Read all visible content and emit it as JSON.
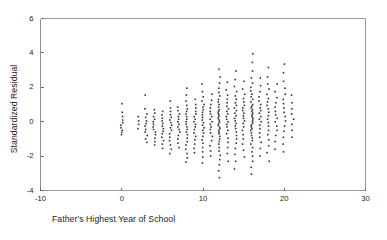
{
  "chart_data": {
    "type": "scatter",
    "title": "",
    "xlabel": "Father's Highest Year of School",
    "ylabel": "Standardized Residual",
    "xlim": [
      -10,
      30
    ],
    "ylim": [
      -4,
      6
    ],
    "xticks": [
      -10,
      0,
      10,
      20,
      30
    ],
    "yticks": [
      -4,
      -2,
      0,
      2,
      4,
      6
    ],
    "xtick_labels": [
      "-10",
      "0",
      "10",
      "20",
      "30"
    ],
    "ytick_labels": [
      "-4",
      "-2",
      "0",
      "2",
      "4",
      "6"
    ],
    "grid": false,
    "legend": false,
    "marker": "small-square",
    "marker_color": "#333333",
    "frame_color": "#9a9a9a",
    "background": "#ffffff",
    "note": "Discrete integer x values (years of school) produce vertical stripes of residuals.",
    "columns": [
      {
        "x": 0,
        "values": [
          0.55,
          0.3,
          0.1,
          -0.05,
          -0.2,
          -0.35,
          -0.5,
          -0.62,
          -0.75,
          1.05
        ]
      },
      {
        "x": 2,
        "values": [
          0.3,
          0.05,
          -0.15,
          -0.4
        ]
      },
      {
        "x": 3,
        "values": [
          1.55,
          0.75,
          0.45,
          0.25,
          0.05,
          -0.1,
          -0.25,
          -0.45,
          -0.6,
          -0.8,
          -1.0,
          -1.2
        ]
      },
      {
        "x": 4,
        "values": [
          0.7,
          0.5,
          0.3,
          0.15,
          0.0,
          -0.15,
          -0.3,
          -0.45,
          -0.6,
          -0.75,
          -0.95,
          -1.15,
          -1.35
        ]
      },
      {
        "x": 5,
        "values": [
          0.6,
          0.4,
          0.2,
          0.05,
          -0.1,
          -0.25,
          -0.4,
          -0.55,
          -0.7,
          -0.9,
          -1.1,
          -1.3,
          -1.55
        ]
      },
      {
        "x": 6,
        "values": [
          1.2,
          0.8,
          0.6,
          0.4,
          0.25,
          0.1,
          -0.05,
          -0.2,
          -0.35,
          -0.5,
          -0.7,
          -0.9,
          -1.1,
          -1.35,
          -1.6,
          -1.85
        ]
      },
      {
        "x": 7,
        "values": [
          0.85,
          0.65,
          0.45,
          0.3,
          0.15,
          0.0,
          -0.15,
          -0.3,
          -0.45,
          -0.6,
          -0.8,
          -1.0,
          -1.25,
          -1.5
        ]
      },
      {
        "x": 8,
        "values": [
          1.95,
          1.55,
          1.2,
          0.95,
          0.75,
          0.6,
          0.45,
          0.3,
          0.15,
          0.0,
          -0.15,
          -0.3,
          -0.45,
          -0.6,
          -0.75,
          -0.95,
          -1.15,
          -1.35,
          -1.6,
          -1.85,
          -2.1,
          -2.35
        ]
      },
      {
        "x": 9,
        "values": [
          1.3,
          1.0,
          0.8,
          0.6,
          0.45,
          0.3,
          0.15,
          0.0,
          -0.15,
          -0.3,
          -0.45,
          -0.65,
          -0.85,
          -1.05,
          -1.3,
          -1.55,
          -1.8
        ]
      },
      {
        "x": 10,
        "values": [
          2.2,
          1.75,
          1.45,
          1.2,
          1.0,
          0.85,
          0.7,
          0.55,
          0.4,
          0.25,
          0.1,
          -0.05,
          -0.2,
          -0.35,
          -0.5,
          -0.65,
          -0.85,
          -1.05,
          -1.25,
          -1.5,
          -1.75,
          -2.05,
          -2.4
        ]
      },
      {
        "x": 11,
        "values": [
          1.6,
          1.25,
          1.0,
          0.8,
          0.6,
          0.45,
          0.3,
          0.15,
          0.0,
          -0.15,
          -0.3,
          -0.45,
          -0.65,
          -0.85,
          -1.1,
          -1.4,
          -1.7,
          -2.0
        ]
      },
      {
        "x": 12,
        "values": [
          3.05,
          2.6,
          2.25,
          1.95,
          1.7,
          1.5,
          1.3,
          1.15,
          1.0,
          0.85,
          0.7,
          0.6,
          0.5,
          0.4,
          0.3,
          0.2,
          0.1,
          0.0,
          -0.1,
          -0.2,
          -0.3,
          -0.4,
          -0.5,
          -0.6,
          -0.7,
          -0.85,
          -1.0,
          -1.15,
          -1.3,
          -1.5,
          -1.7,
          -1.95,
          -2.2,
          -2.5,
          -2.85,
          -3.25
        ]
      },
      {
        "x": 13,
        "values": [
          2.3,
          1.85,
          1.55,
          1.3,
          1.1,
          0.9,
          0.75,
          0.6,
          0.45,
          0.3,
          0.15,
          0.0,
          -0.15,
          -0.3,
          -0.5,
          -0.7,
          -0.95,
          -1.2,
          -1.5,
          -1.85,
          -2.3
        ]
      },
      {
        "x": 14,
        "values": [
          2.95,
          2.45,
          2.05,
          1.75,
          1.5,
          1.3,
          1.1,
          0.95,
          0.8,
          0.65,
          0.5,
          0.35,
          0.2,
          0.05,
          -0.1,
          -0.25,
          -0.4,
          -0.6,
          -0.8,
          -1.0,
          -1.25,
          -1.55,
          -1.9,
          -2.3,
          -2.75
        ]
      },
      {
        "x": 15,
        "values": [
          2.35,
          1.9,
          1.6,
          1.35,
          1.15,
          0.95,
          0.8,
          0.65,
          0.5,
          0.35,
          0.2,
          0.05,
          -0.1,
          -0.3,
          -0.5,
          -0.75,
          -1.0,
          -1.3,
          -1.65,
          -2.05
        ]
      },
      {
        "x": 16,
        "values": [
          3.95,
          3.45,
          2.95,
          2.55,
          2.25,
          2.0,
          1.8,
          1.6,
          1.45,
          1.3,
          1.15,
          1.0,
          0.9,
          0.8,
          0.7,
          0.6,
          0.5,
          0.4,
          0.3,
          0.2,
          0.1,
          0.0,
          -0.1,
          -0.2,
          -0.3,
          -0.4,
          -0.5,
          -0.65,
          -0.8,
          -0.95,
          -1.1,
          -1.3,
          -1.5,
          -1.75,
          -2.0,
          -2.3,
          -2.65,
          -3.05
        ]
      },
      {
        "x": 17,
        "values": [
          2.55,
          2.1,
          1.75,
          1.45,
          1.2,
          1.0,
          0.8,
          0.65,
          0.5,
          0.3,
          0.15,
          0.0,
          -0.2,
          -0.4,
          -0.65,
          -0.9,
          -1.2,
          -1.55,
          -2.0
        ]
      },
      {
        "x": 18,
        "values": [
          3.15,
          2.6,
          2.2,
          1.9,
          1.6,
          1.35,
          1.15,
          0.95,
          0.75,
          0.55,
          0.35,
          0.15,
          -0.05,
          -0.25,
          -0.5,
          -0.75,
          -1.05,
          -1.4,
          -1.8,
          -2.3
        ]
      },
      {
        "x": 19,
        "values": [
          2.2,
          1.75,
          1.4,
          1.1,
          0.85,
          0.6,
          0.4,
          0.2,
          0.0,
          -0.25,
          -0.5,
          -0.8,
          -1.15,
          -1.6
        ]
      },
      {
        "x": 20,
        "values": [
          3.35,
          2.85,
          2.35,
          1.95,
          1.6,
          1.3,
          1.05,
          0.8,
          0.55,
          0.3,
          0.05,
          -0.25,
          -0.55,
          -0.9,
          -1.3,
          -1.75
        ]
      },
      {
        "x": 21,
        "values": [
          1.55,
          1.1,
          0.75,
          0.45,
          0.15,
          -0.15,
          -0.5,
          -0.9
        ]
      }
    ]
  },
  "axes": {
    "xlabel": "Father's Highest Year of School",
    "ylabel": "Standardized Residual"
  }
}
